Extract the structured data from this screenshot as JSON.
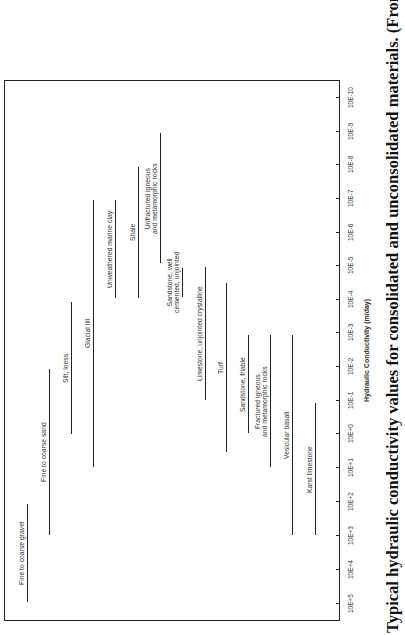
{
  "chart_data": {
    "type": "bar",
    "orientation": "range bars (rotated figure, log scale)",
    "title": "Typical hydraulic conductivity values for consolidated and unconsolidated materials. (From Driscoll, F. G.,",
    "xlabel": "Hydraulic Conductivity (m/day)",
    "ylabel": "",
    "scale": "log10",
    "axis_range": [
      100000,
      1e-10
    ],
    "tick_labels": [
      "10E+5",
      "10E+4",
      "10E+3",
      "10E+2",
      "10E+1",
      "10E+0",
      "10E-1",
      "10E-2",
      "10E-3",
      "10E-4",
      "10E-5",
      "10E-6",
      "10E-7",
      "10E-8",
      "10E-9",
      "10E-10"
    ],
    "grid": false,
    "legend": "none (labels beside bars)",
    "categories": [
      "Fine to coarse gravel",
      "Fine to coarse sand",
      "Silt, loess",
      "Glacial till",
      "Unweathered marine clay",
      "Shale",
      "Unfractured igneous and metamorphic rocks",
      "Sandstone, well cemented, unjointed",
      "Limestone, unjointed crystalline",
      "Turf",
      "Sandstone, friable",
      "Fractured igneous and metamorphic rocks",
      "Vesicular basalt",
      "Karst limestone"
    ],
    "series": [
      {
        "name": "max_log10_K",
        "values": [
          5,
          3,
          0,
          1,
          -4,
          -4,
          -5,
          -4,
          -1,
          0.5,
          0,
          1,
          3,
          3
        ]
      },
      {
        "name": "min_log10_K",
        "values": [
          2,
          -2,
          -4,
          -7,
          -7,
          -8,
          -9,
          -5,
          -5,
          -5.5,
          -3,
          -3,
          -3,
          -1
        ]
      }
    ]
  },
  "figure": {
    "caption": "Typical hydraulic conductivity values for consolidated and unconsolidated materials. (From Driscoll, F. G.,",
    "axis_title": "Hydraulic Conductivity (m/day)",
    "ticks": [
      {
        "label": "10E+5",
        "y": 603
      },
      {
        "label": "10E+4",
        "y": 569
      },
      {
        "label": "10E+3",
        "y": 535
      },
      {
        "label": "10E+2",
        "y": 501
      },
      {
        "label": "10E+1",
        "y": 467
      },
      {
        "label": "10E+0",
        "y": 433
      },
      {
        "label": "10E-1",
        "y": 400
      },
      {
        "label": "10E-2",
        "y": 366
      },
      {
        "label": "10E-3",
        "y": 332
      },
      {
        "label": "10E-4",
        "y": 299
      },
      {
        "label": "10E-5",
        "y": 265
      },
      {
        "label": "10E-6",
        "y": 232
      },
      {
        "label": "10E-7",
        "y": 198
      },
      {
        "label": "10E-8",
        "y": 164
      },
      {
        "label": "10E-9",
        "y": 131
      },
      {
        "label": "10E-10",
        "y": 97
      }
    ],
    "bars": [
      {
        "label1": "Fine to coarse gravel",
        "label2": "",
        "x": 27,
        "top": 504,
        "bottom": 602
      },
      {
        "label1": "Fine to coarse sand",
        "label2": "",
        "x": 49,
        "top": 369,
        "bottom": 535
      },
      {
        "label1": "Silt, loess",
        "label2": "",
        "x": 71,
        "top": 302,
        "bottom": 434
      },
      {
        "label1": "Glacial till",
        "label2": "",
        "x": 93,
        "top": 200,
        "bottom": 467
      },
      {
        "label1": "Unweathered marine clay",
        "label2": "",
        "x": 115,
        "top": 200,
        "bottom": 298
      },
      {
        "label1": "Shale",
        "label2": "",
        "x": 138,
        "top": 167,
        "bottom": 298
      },
      {
        "label1": "Unfractured igneous",
        "label2": "and metamorphic rocks",
        "x": 160,
        "top": 133,
        "bottom": 263
      },
      {
        "label1": "Sandstone, well",
        "label2": "cemented, unjointed",
        "x": 182,
        "top": 268,
        "bottom": 297
      },
      {
        "label1": "Limestone, unjointed crystalline",
        "label2": "",
        "x": 205,
        "top": 267,
        "bottom": 400
      },
      {
        "label1": "Turf",
        "label2": "",
        "x": 226,
        "top": 283,
        "bottom": 452
      },
      {
        "label1": "Sandstone, friable",
        "label2": "",
        "x": 248,
        "top": 335,
        "bottom": 433
      },
      {
        "label1": "Fractured igneous",
        "label2": "and metamorphic rocks",
        "x": 270,
        "top": 335,
        "bottom": 467
      },
      {
        "label1": "Vesicular basalt",
        "label2": "",
        "x": 292,
        "top": 335,
        "bottom": 535
      },
      {
        "label1": "Karst limestone",
        "label2": "",
        "x": 315,
        "top": 403,
        "bottom": 535
      }
    ]
  }
}
